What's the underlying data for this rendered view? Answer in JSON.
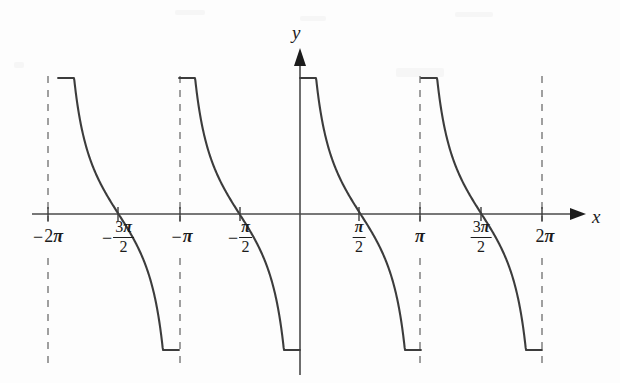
{
  "figure": {
    "background_color": "#fdfdfd",
    "curve_color": "#3c3c3c",
    "axis_color": "#4a4a4a",
    "asymptote_color": "#6e6e6e"
  },
  "axes": {
    "x_label": "x",
    "y_label": "y",
    "x_axis_y_px": 214,
    "y_axis_x_px": 300,
    "px_per_half_pi": 60.5,
    "x_arrow_tip_px": 585,
    "y_arrow_tip_px": 48
  },
  "ticks": [
    {
      "name": "tick--2pi",
      "x_px": 48,
      "value": -6.2832,
      "label_sign": "−",
      "label_main": "2",
      "label_pi": "π",
      "is_fraction": false
    },
    {
      "name": "tick--3pi-over-2",
      "x_px": 118,
      "value": -4.7124,
      "label_sign": "−",
      "label_num": "3",
      "label_pi": "π",
      "label_den": "2",
      "is_fraction": true
    },
    {
      "name": "tick--pi",
      "x_px": 180,
      "value": -3.1416,
      "label_sign": "−",
      "label_main": "",
      "label_pi": "π",
      "is_fraction": false
    },
    {
      "name": "tick--pi-over-2",
      "x_px": 240,
      "value": -1.5708,
      "label_sign": "−",
      "label_num": "",
      "label_pi": "π",
      "label_den": "2",
      "is_fraction": true
    },
    {
      "name": "tick-pi-over-2",
      "x_px": 359,
      "value": 1.5708,
      "label_sign": "",
      "label_num": "",
      "label_pi": "π",
      "label_den": "2",
      "is_fraction": true
    },
    {
      "name": "tick-pi",
      "x_px": 420,
      "value": 3.1416,
      "label_sign": "",
      "label_main": "",
      "label_pi": "π",
      "is_fraction": false
    },
    {
      "name": "tick-3pi-over-2",
      "x_px": 481,
      "value": 4.7124,
      "label_sign": "",
      "label_num": "3",
      "label_pi": "π",
      "label_den": "2",
      "is_fraction": true
    },
    {
      "name": "tick-2pi",
      "x_px": 542,
      "value": 6.2832,
      "label_sign": "",
      "label_main": "2",
      "label_pi": "π",
      "is_fraction": false
    }
  ],
  "chart_data": {
    "type": "line",
    "title": "",
    "subtitle": "",
    "xlabel": "x",
    "ylabel": "y",
    "function": "y = cot(x)",
    "grid": false,
    "legend": null,
    "xlim": [
      -7.2,
      7.0
    ],
    "ylim": [
      -2.25,
      2.25
    ],
    "asymptotes_x": [
      -6.2832,
      -3.1416,
      0,
      3.1416,
      6.2832
    ],
    "asymptote_style": "dashed",
    "zeros_x": [
      -4.7124,
      -1.5708,
      1.5708,
      4.7124
    ],
    "xtick_values": [
      -6.2832,
      -4.7124,
      -3.1416,
      -1.5708,
      1.5708,
      3.1416,
      4.7124,
      6.2832
    ],
    "xtick_labels": [
      "−2π",
      "−3π/2",
      "−π",
      "−π/2",
      "π/2",
      "π",
      "3π/2",
      "2π"
    ],
    "ytick_values": [],
    "ytick_labels": [],
    "branches": [
      {
        "name": "branch--2pi-to--pi",
        "domain": [
          -6.2832,
          -3.1416
        ]
      },
      {
        "name": "branch--pi-to-0",
        "domain": [
          -3.1416,
          0
        ]
      },
      {
        "name": "branch-0-to-pi",
        "domain": [
          0,
          3.1416
        ]
      },
      {
        "name": "branch-pi-to-2pi",
        "domain": [
          3.1416,
          6.2832
        ]
      }
    ],
    "series": [
      {
        "name": "cot(x)",
        "color": "#3c3c3c",
        "x": [
          -6.28,
          -6.23,
          -6.15,
          -6.05,
          -5.9,
          -5.7,
          -5.5,
          -5.3,
          -5.1,
          -4.95,
          -4.71,
          -4.5,
          -4.3,
          -4.1,
          -3.9,
          -3.7,
          -3.5,
          -3.35,
          -3.24,
          -3.18,
          -3.14,
          -3.09,
          -3.01,
          -2.91,
          -2.76,
          -2.56,
          -2.36,
          -2.16,
          -1.96,
          -1.81,
          -1.57,
          -1.36,
          -1.16,
          -0.96,
          -0.76,
          -0.56,
          -0.36,
          -0.21,
          -0.1,
          -0.04,
          0.04,
          0.1,
          0.21,
          0.36,
          0.56,
          0.76,
          0.96,
          1.16,
          1.36,
          1.57,
          1.81,
          1.96,
          2.16,
          2.36,
          2.56,
          2.76,
          2.91,
          3.01,
          3.09,
          3.14,
          3.18,
          3.24,
          3.35,
          3.5,
          3.7,
          3.9,
          4.1,
          4.3,
          4.5,
          4.71,
          4.95,
          5.1,
          5.3,
          5.5,
          5.7,
          5.9,
          6.05,
          6.15,
          6.23,
          6.28
        ],
        "y": [
          2.25,
          2.1,
          1.55,
          1.05,
          0.63,
          0.33,
          0.17,
          0.05,
          -0.06,
          -0.15,
          -0.34,
          -0.56,
          -0.8,
          -1.1,
          -1.55,
          -2.2,
          -2.25,
          -2.25,
          -2.25,
          -2.25,
          2.25,
          2.1,
          1.55,
          1.05,
          0.63,
          0.33,
          0.17,
          0.05,
          -0.06,
          -0.15,
          -0.34,
          -0.56,
          -0.8,
          -1.1,
          -1.55,
          -2.2,
          -2.25,
          -2.25,
          -2.25,
          -2.25,
          2.25,
          2.1,
          1.55,
          1.05,
          0.63,
          0.33,
          0.17,
          0.05,
          -0.06,
          -0.34,
          -0.56,
          -0.8,
          -1.1,
          -1.55,
          -2.2,
          -2.25,
          -2.25,
          -2.25,
          -2.25,
          -2.25,
          2.25,
          2.1,
          1.55,
          1.05,
          0.63,
          0.33,
          0.17,
          0.05,
          -0.06,
          -0.34,
          -0.56,
          -0.8,
          -1.1,
          -1.55,
          -2.2,
          -2.25,
          -2.25,
          -2.25,
          -2.25,
          -2.25
        ]
      }
    ]
  }
}
